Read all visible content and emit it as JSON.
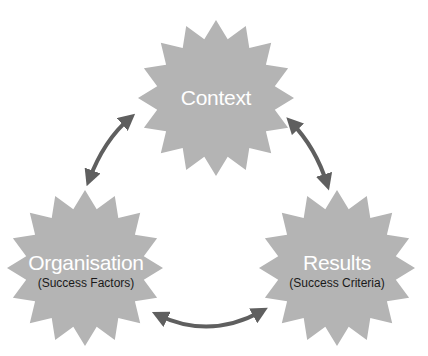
{
  "diagram": {
    "colors": {
      "star_fill": "#b4b4b4",
      "arrow": "#5f5f5f",
      "main_text": "#ffffff",
      "sub_text": "#1a1a1a"
    },
    "nodes": [
      {
        "id": "context",
        "label": "Context",
        "sublabel": null,
        "cx": 216,
        "cy": 98
      },
      {
        "id": "organisation",
        "label": "Organisation",
        "sublabel": "(Success Factors)",
        "cx": 85,
        "cy": 268
      },
      {
        "id": "results",
        "label": "Results",
        "sublabel": "(Success Criteria)",
        "cx": 337,
        "cy": 268
      }
    ],
    "edges": [
      {
        "from": "organisation",
        "to": "context",
        "type": "bidirectional"
      },
      {
        "from": "context",
        "to": "results",
        "type": "bidirectional"
      },
      {
        "from": "organisation",
        "to": "results",
        "type": "bidirectional"
      }
    ]
  }
}
